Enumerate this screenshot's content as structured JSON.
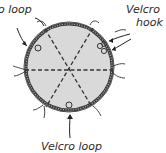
{
  "diagram": {
    "type": "velcro-disc-illustration",
    "labels": {
      "top_left": "o loop",
      "top_right_line1": "Velcro",
      "top_right_line2": "hook",
      "bottom": "Velcro loop"
    },
    "colors": {
      "disc_fill": "#d9d9d9",
      "rim": "#3a3a3a",
      "lines": "#333333",
      "text": "#2a2a2a"
    }
  }
}
